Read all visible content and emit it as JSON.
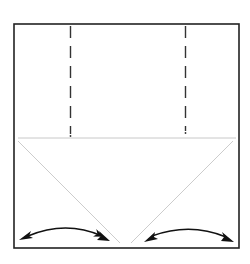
{
  "diagram": {
    "type": "origami-fold-step",
    "colors": {
      "border": "#222222",
      "dashed_fold": "#333333",
      "crease": "#c8c8c8",
      "arrow": "#111111",
      "background": "#ffffff"
    },
    "paper": {
      "x": 14,
      "y": 24,
      "width": 225,
      "height": 224
    },
    "folds": [
      {
        "kind": "valley-fold-dashed",
        "x": 70,
        "y1": 26,
        "y2": 136
      },
      {
        "kind": "valley-fold-dashed",
        "x": 185,
        "y1": 26,
        "y2": 134
      }
    ],
    "creases": [
      {
        "kind": "horizontal-crease",
        "x1": 18,
        "y1": 138,
        "x2": 236,
        "y2": 138
      },
      {
        "kind": "diagonal-crease-left",
        "x1": 18,
        "y1": 141,
        "x2": 120,
        "y2": 243
      },
      {
        "kind": "diagonal-crease-right",
        "x1": 233,
        "y1": 141,
        "x2": 131,
        "y2": 243
      }
    ],
    "arrows": [
      {
        "kind": "fold-and-unfold-left",
        "from": [
          20,
          239
        ],
        "to": [
          108,
          240
        ]
      },
      {
        "kind": "fold-and-unfold-right",
        "from": [
          145,
          241
        ],
        "to": [
          232,
          241
        ]
      }
    ]
  }
}
